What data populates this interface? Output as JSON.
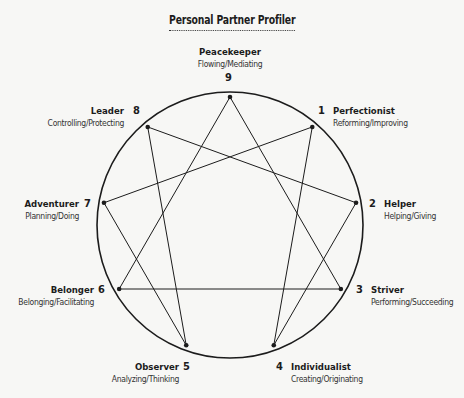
{
  "title": "Personal Partner Profiler",
  "points": [
    {
      "number": "1",
      "name": "Perfectionist",
      "desc": "Reforming/Improving"
    },
    {
      "number": "2",
      "name": "Helper",
      "desc": "Helping/Giving"
    },
    {
      "number": "3",
      "name": "Striver",
      "desc": "Performing/Succeeding"
    },
    {
      "number": "4",
      "name": "Individualist",
      "desc": "Creating/Originating"
    },
    {
      "number": "5",
      "name": "Observer",
      "desc": "Analyzing/Thinking"
    },
    {
      "number": "6",
      "name": "Belonger",
      "desc": "Belonging/Facilitating"
    },
    {
      "number": "7",
      "name": "Adventurer",
      "desc": "Planning/Doing"
    },
    {
      "number": "8",
      "name": "Leader",
      "desc": "Controlling/Protecting"
    },
    {
      "number": "9",
      "name": "Peacekeeper",
      "desc": "Flowing/Mediating"
    }
  ],
  "connections": {
    "triangle": [
      "9",
      "3",
      "6",
      "9"
    ],
    "hexad": [
      "1",
      "4",
      "2",
      "8",
      "5",
      "7",
      "1"
    ]
  },
  "colors": {
    "line": "#1c1c1c",
    "background": "#f7f7f5"
  }
}
